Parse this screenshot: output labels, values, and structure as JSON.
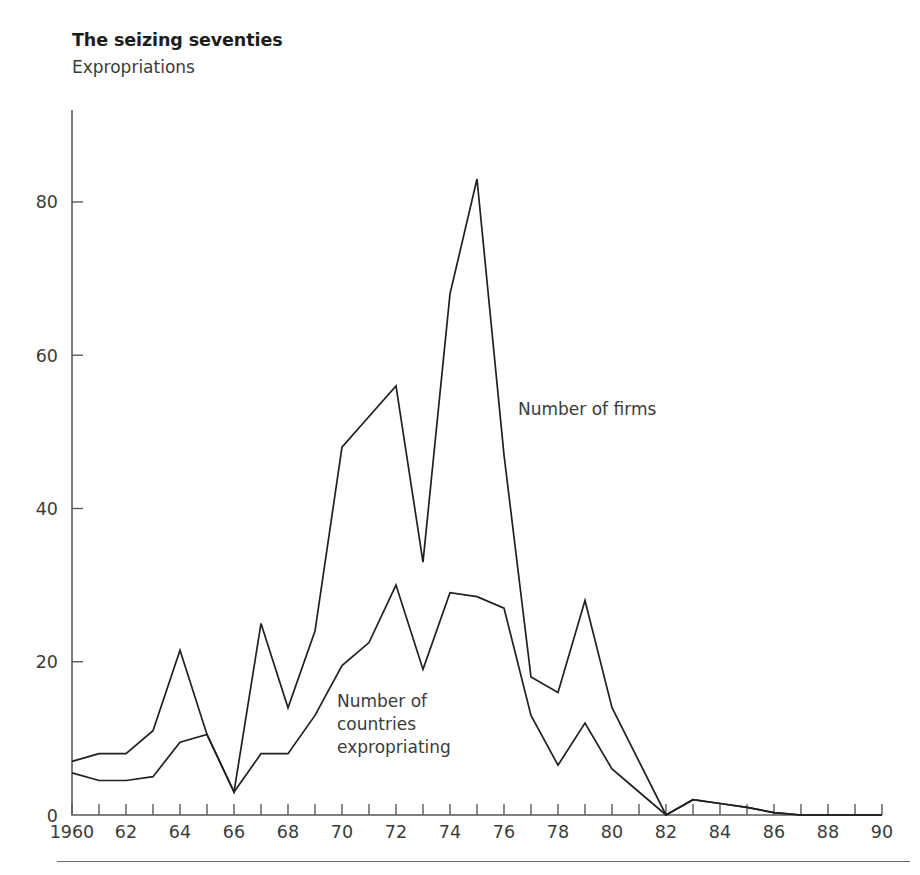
{
  "header": {
    "title": "The seizing seventies",
    "subtitle": "Expropriations"
  },
  "annotations": {
    "firms_label": "Number of firms",
    "countries_label_line1": "Number of",
    "countries_label_line2": "countries",
    "countries_label_line3": "expropriating",
    "countries_label": "Number of countries expropriating"
  },
  "axes": {
    "y_ticks": [
      "0",
      "20",
      "40",
      "60",
      "80"
    ],
    "y_tick_values": [
      0,
      20,
      40,
      60,
      80
    ],
    "y_min": 0,
    "y_max": 92,
    "x_first_label": "1960",
    "x_labels": [
      "1960",
      "62",
      "64",
      "66",
      "68",
      "70",
      "72",
      "74",
      "76",
      "78",
      "80",
      "82",
      "84",
      "86",
      "88",
      "90"
    ],
    "x_label_values": [
      1960,
      1962,
      1964,
      1966,
      1968,
      1970,
      1972,
      1974,
      1976,
      1978,
      1980,
      1982,
      1984,
      1986,
      1988,
      1990
    ],
    "x_min": 1960,
    "x_max": 1990
  },
  "colors": {
    "line": "#231f20",
    "axis": "#58595b",
    "text": "#3b3b3b",
    "background": "#ffffff"
  },
  "chart_data": {
    "type": "line",
    "title": "The seizing seventies",
    "subtitle": "Expropriations",
    "xlabel": "",
    "ylabel": "",
    "xlim": [
      1960,
      1990
    ],
    "ylim": [
      0,
      92
    ],
    "grid": false,
    "legend": "inline-annotations",
    "x": [
      1960,
      1961,
      1962,
      1963,
      1964,
      1965,
      1966,
      1967,
      1968,
      1969,
      1970,
      1971,
      1972,
      1973,
      1974,
      1975,
      1976,
      1977,
      1978,
      1979,
      1980,
      1981,
      1982,
      1983,
      1984,
      1985,
      1986,
      1987,
      1988,
      1989,
      1990
    ],
    "series": [
      {
        "name": "Number of firms",
        "values": [
          7,
          8,
          8,
          11,
          21.5,
          10.5,
          3,
          25,
          14,
          24,
          48,
          52,
          56,
          33,
          68,
          83,
          47,
          18,
          16,
          28,
          14,
          7,
          0,
          2,
          1.5,
          1,
          0.3,
          0,
          0,
          0,
          0
        ]
      },
      {
        "name": "Number of countries expropriating",
        "values": [
          5.5,
          4.5,
          4.5,
          5,
          9.5,
          10.5,
          3,
          8,
          8,
          13,
          19.5,
          22.5,
          30,
          19,
          29,
          28.5,
          27,
          13,
          6.5,
          12,
          6,
          3,
          0,
          2,
          1.5,
          1,
          0.3,
          0,
          0,
          0,
          0
        ]
      }
    ]
  }
}
